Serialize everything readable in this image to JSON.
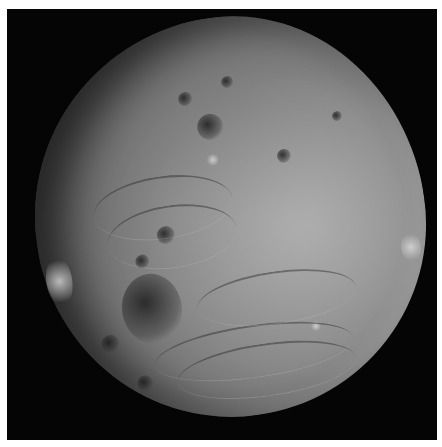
{
  "image": {
    "subject": "asteroid",
    "description": "Grayscale photograph of a heavily cratered asteroid against black space",
    "colors": {
      "background": "#050505",
      "border": "#ffffff",
      "surface_light": "#b8b8b8",
      "surface_mid": "#858585",
      "surface_dark": "#3a3a3a"
    }
  }
}
